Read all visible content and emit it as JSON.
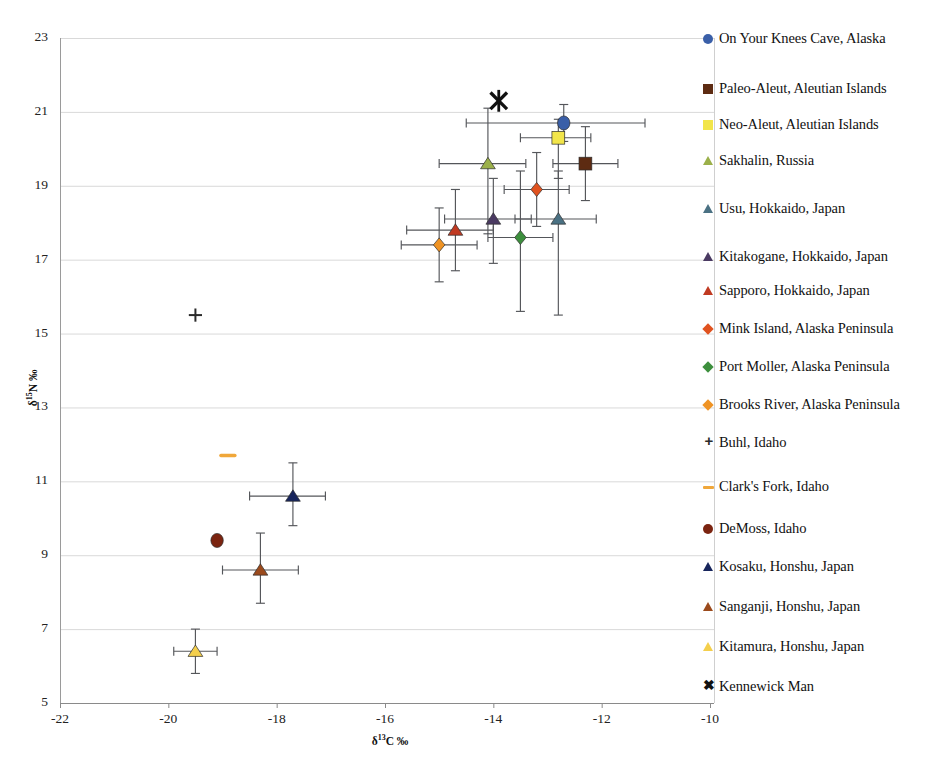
{
  "chart_data": {
    "type": "scatter",
    "title": "",
    "xlabel": "δ¹³C ‰",
    "ylabel": "δ¹⁵N ‰",
    "xlim": [
      -22,
      -10
    ],
    "ylim": [
      5,
      23
    ],
    "xticks": [
      "-22",
      "-20",
      "-18",
      "-16",
      "-14",
      "-12",
      "-10"
    ],
    "yticks": [
      "23",
      "21",
      "19",
      "17",
      "15",
      "13",
      "11",
      "9",
      "7",
      "5"
    ],
    "grid": "horizontal",
    "legend_position": "right",
    "series": [
      {
        "name": "On Your Knees Cave, Alaska",
        "marker": "circle",
        "color": "#3a5fa8",
        "x": -12.7,
        "y": 20.7,
        "xerr_low": -14.5,
        "xerr_high": -11.2,
        "yerr_low": 20.2,
        "yerr_high": 21.2
      },
      {
        "name": "Paleo-Aleut, Aleutian Islands",
        "marker": "square",
        "color": "#5d2b12",
        "x": -12.3,
        "y": 19.6,
        "xerr_low": -12.9,
        "xerr_high": -11.7,
        "yerr_low": 18.6,
        "yerr_high": 20.6
      },
      {
        "name": "Neo-Aleut, Aleutian Islands",
        "marker": "square",
        "color": "#f2e54a",
        "x": -12.8,
        "y": 20.3,
        "xerr_low": -13.5,
        "xerr_high": -12.2,
        "yerr_low": 19.2,
        "yerr_high": 20.8
      },
      {
        "name": "Sakhalin, Russia",
        "marker": "triangle",
        "color": "#9bb04a",
        "x": -14.1,
        "y": 19.6,
        "xerr_low": -15.0,
        "xerr_high": -13.4,
        "yerr_low": 17.7,
        "yerr_high": 21.1
      },
      {
        "name": "Usu, Hokkaido, Japan",
        "marker": "triangle",
        "color": "#4a7183",
        "x": -12.8,
        "y": 18.1,
        "xerr_low": -13.6,
        "xerr_high": -12.1,
        "yerr_low": 15.5,
        "yerr_high": 19.4
      },
      {
        "name": "Kitakogane, Hokkaido, Japan",
        "marker": "triangle",
        "color": "#4a3a62",
        "x": -14.0,
        "y": 18.1,
        "xerr_low": -14.9,
        "xerr_high": -13.3,
        "yerr_low": 16.9,
        "yerr_high": 19.2
      },
      {
        "name": "Sapporo, Hokkaido, Japan",
        "marker": "triangle",
        "color": "#c03a22",
        "x": -14.7,
        "y": 17.8,
        "xerr_low": -15.6,
        "xerr_high": -14.0,
        "yerr_low": 16.7,
        "yerr_high": 18.9
      },
      {
        "name": "Mink Island, Alaska Peninsula",
        "marker": "diamond",
        "color": "#e0521f",
        "x": -13.2,
        "y": 18.9,
        "xerr_low": -13.8,
        "xerr_high": -12.6,
        "yerr_low": 17.9,
        "yerr_high": 19.9
      },
      {
        "name": "Port Moller, Alaska Peninsula",
        "marker": "diamond",
        "color": "#3d8f3d",
        "x": -13.5,
        "y": 17.6,
        "xerr_low": -14.1,
        "xerr_high": -12.9,
        "yerr_low": 15.6,
        "yerr_high": 19.4
      },
      {
        "name": "Brooks River, Alaska Peninsula",
        "marker": "diamond",
        "color": "#ef9324",
        "x": -15.0,
        "y": 17.4,
        "xerr_low": -15.7,
        "xerr_high": -14.3,
        "yerr_low": 16.4,
        "yerr_high": 18.4
      },
      {
        "name": "Buhl, Idaho",
        "marker": "plus",
        "color": "#2b2b2b",
        "x": -19.5,
        "y": 15.5,
        "xerr_low": null,
        "xerr_high": null,
        "yerr_low": null,
        "yerr_high": null
      },
      {
        "name": "Clark's Fork, Idaho",
        "marker": "dash",
        "color": "#f0a73a",
        "x": -18.9,
        "y": 11.7,
        "xerr_low": null,
        "xerr_high": null,
        "yerr_low": null,
        "yerr_high": null
      },
      {
        "name": "DeMoss, Idaho",
        "marker": "circle",
        "color": "#7b2410",
        "x": -19.1,
        "y": 9.4,
        "xerr_low": null,
        "xerr_high": null,
        "yerr_low": null,
        "yerr_high": null
      },
      {
        "name": "Kosaku, Honshu, Japan",
        "marker": "triangle",
        "color": "#17255c",
        "x": -17.7,
        "y": 10.6,
        "xerr_low": -18.5,
        "xerr_high": -17.1,
        "yerr_low": 9.8,
        "yerr_high": 11.5
      },
      {
        "name": "Sanganji, Honshu, Japan",
        "marker": "triangle",
        "color": "#9b4a1c",
        "x": -18.3,
        "y": 8.6,
        "xerr_low": -19.0,
        "xerr_high": -17.6,
        "yerr_low": 7.7,
        "yerr_high": 9.6
      },
      {
        "name": "Kitamura, Honshu, Japan",
        "marker": "triangle",
        "color": "#f4cf4c",
        "x": -19.5,
        "y": 6.4,
        "xerr_low": -19.9,
        "xerr_high": -19.1,
        "yerr_low": 5.8,
        "yerr_high": 7.0
      },
      {
        "name": "Kennewick Man",
        "marker": "asterisk",
        "color": "#111111",
        "x": -13.9,
        "y": 21.3,
        "xerr_low": null,
        "xerr_high": null,
        "yerr_low": null,
        "yerr_high": null
      }
    ]
  },
  "legend": {
    "items": [
      {
        "label": "On Your Knees Cave, Alaska",
        "marker": "circle",
        "color": "#3a5fa8"
      },
      {
        "label": "Paleo-Aleut, Aleutian Islands",
        "marker": "square",
        "color": "#5d2b12"
      },
      {
        "label": "Neo-Aleut, Aleutian Islands",
        "marker": "square",
        "color": "#f2e54a"
      },
      {
        "label": "Sakhalin, Russia",
        "marker": "triangle",
        "color": "#9bb04a"
      },
      {
        "label": "Usu, Hokkaido, Japan",
        "marker": "triangle",
        "color": "#4a7183"
      },
      {
        "label": "Kitakogane, Hokkaido, Japan",
        "marker": "triangle",
        "color": "#4a3a62"
      },
      {
        "label": "Sapporo, Hokkaido, Japan",
        "marker": "triangle",
        "color": "#c03a22"
      },
      {
        "label": "Mink Island, Alaska Peninsula",
        "marker": "diamond",
        "color": "#e0521f"
      },
      {
        "label": "Port Moller, Alaska Peninsula",
        "marker": "diamond",
        "color": "#3d8f3d"
      },
      {
        "label": "Brooks River, Alaska Peninsula",
        "marker": "diamond",
        "color": "#ef9324"
      },
      {
        "label": "Buhl, Idaho",
        "marker": "plus",
        "color": "#2b2b2b"
      },
      {
        "label": "Clark's Fork, Idaho",
        "marker": "dash",
        "color": "#f0a73a"
      },
      {
        "label": "DeMoss, Idaho",
        "marker": "circle",
        "color": "#7b2410"
      },
      {
        "label": "Kosaku, Honshu, Japan",
        "marker": "triangle",
        "color": "#17255c"
      },
      {
        "label": "Sanganji, Honshu, Japan",
        "marker": "triangle",
        "color": "#9b4a1c"
      },
      {
        "label": "Kitamura, Honshu, Japan",
        "marker": "triangle",
        "color": "#f4cf4c"
      },
      {
        "label": "Kennewick Man",
        "marker": "asterisk",
        "color": "#111111"
      }
    ]
  },
  "axes": {
    "y_title_html": "δ<sup>15</sup>N ‰",
    "x_title_html": "δ<sup>13</sup>C ‰"
  }
}
